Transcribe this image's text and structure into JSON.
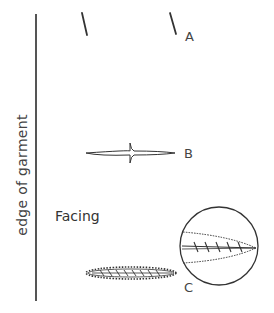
{
  "diagram": {
    "edge_label": "edge of garment",
    "facing_label": "Facing",
    "labels": {
      "a": "A",
      "b": "B",
      "c": "C"
    }
  }
}
